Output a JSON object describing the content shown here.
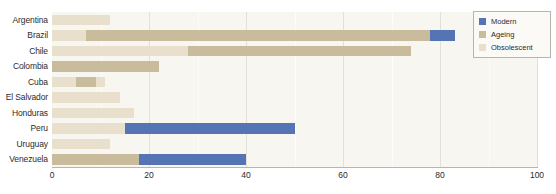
{
  "chart_data": {
    "type": "bar",
    "orientation": "horizontal",
    "stacked": true,
    "title": "",
    "subtitle": "",
    "xlabel": "",
    "ylabel": "",
    "xlim": [
      0,
      100
    ],
    "ylim": null,
    "grid": true,
    "legend_position": "top-right",
    "xticks": [
      0,
      20,
      40,
      60,
      80,
      100
    ],
    "xtick_labels": [
      "0",
      "20",
      "40",
      "60",
      "80",
      "100"
    ],
    "minor_gridlines": [
      10,
      30,
      50,
      70,
      90
    ],
    "categories": [
      "Argentina",
      "Brazil",
      "Chile",
      "Colombia",
      "Cuba",
      "El Salvador",
      "Honduras",
      "Peru",
      "Uruguay",
      "Venezuela"
    ],
    "series": [
      {
        "name": "Modern",
        "color": "#5474b4",
        "values": [
          0,
          5,
          0,
          0,
          0,
          0,
          0,
          35,
          0,
          22
        ]
      },
      {
        "name": "Ageing",
        "color": "#c9bc9c",
        "values": [
          0,
          71,
          46,
          22,
          4,
          0,
          0,
          0,
          0,
          18
        ]
      },
      {
        "name": "Obsolescent",
        "color": "#e8e0cd",
        "values": [
          12,
          7,
          28,
          0,
          7,
          14,
          17,
          15,
          12,
          0
        ]
      }
    ],
    "bars": [
      {
        "category": "Argentina",
        "total": 12,
        "segments": [
          {
            "series": "Obsolescent",
            "start": 0,
            "end": 12,
            "color": "#e8e0cd"
          }
        ]
      },
      {
        "category": "Brazil",
        "total": 83,
        "segments": [
          {
            "series": "Obsolescent",
            "start": 0,
            "end": 7,
            "color": "#e8e0cd"
          },
          {
            "series": "Ageing",
            "start": 7,
            "end": 78,
            "color": "#c9bc9c"
          },
          {
            "series": "Modern",
            "start": 78,
            "end": 83,
            "color": "#5474b4"
          }
        ]
      },
      {
        "category": "Chile",
        "total": 74,
        "segments": [
          {
            "series": "Obsolescent",
            "start": 0,
            "end": 28,
            "color": "#e8e0cd"
          },
          {
            "series": "Ageing",
            "start": 28,
            "end": 74,
            "color": "#c9bc9c"
          }
        ]
      },
      {
        "category": "Colombia",
        "total": 22,
        "segments": [
          {
            "series": "Ageing",
            "start": 0,
            "end": 22,
            "color": "#c9bc9c"
          }
        ]
      },
      {
        "category": "Cuba",
        "total": 11,
        "segments": [
          {
            "series": "Obsolescent",
            "start": 0,
            "end": 5,
            "color": "#e8e0cd"
          },
          {
            "series": "Ageing",
            "start": 5,
            "end": 9,
            "color": "#c9bc9c"
          },
          {
            "series": "Obsolescent",
            "start": 9,
            "end": 11,
            "color": "#e8e0cd"
          }
        ]
      },
      {
        "category": "El Salvador",
        "total": 14,
        "segments": [
          {
            "series": "Obsolescent",
            "start": 0,
            "end": 14,
            "color": "#e8e0cd"
          }
        ]
      },
      {
        "category": "Honduras",
        "total": 17,
        "segments": [
          {
            "series": "Obsolescent",
            "start": 0,
            "end": 17,
            "color": "#e8e0cd"
          }
        ]
      },
      {
        "category": "Peru",
        "total": 50,
        "segments": [
          {
            "series": "Obsolescent",
            "start": 0,
            "end": 15,
            "color": "#e8e0cd"
          },
          {
            "series": "Modern",
            "start": 15,
            "end": 50,
            "color": "#5474b4"
          }
        ]
      },
      {
        "category": "Uruguay",
        "total": 12,
        "segments": [
          {
            "series": "Obsolescent",
            "start": 0,
            "end": 12,
            "color": "#e8e0cd"
          }
        ]
      },
      {
        "category": "Venezuela",
        "total": 40,
        "segments": [
          {
            "series": "Ageing",
            "start": 0,
            "end": 18,
            "color": "#c9bc9c"
          },
          {
            "series": "Modern",
            "start": 18,
            "end": 40,
            "color": "#5474b4"
          }
        ]
      }
    ],
    "legend": [
      {
        "label": "Modern",
        "color": "#5474b4"
      },
      {
        "label": "Ageing",
        "color": "#c9bc9c"
      },
      {
        "label": "Obsolescent",
        "color": "#e8e0cd"
      }
    ]
  },
  "colors": {
    "modern": "#5474b4",
    "ageing": "#c9bc9c",
    "obsolescent": "#e8e0cd",
    "plot_background": "#f8f6f1",
    "page_background": "#ffffff",
    "axis_line": "#b9b5ab",
    "text": "#2b2b2b"
  }
}
